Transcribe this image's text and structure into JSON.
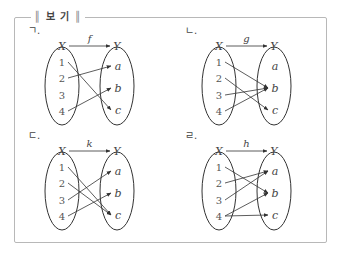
{
  "box": {
    "title": "보 기",
    "title_left_bar": "║",
    "title_right_bar": "║"
  },
  "colors": {
    "border": "#b8b8b8",
    "stroke": "#333333",
    "text": "#444444"
  },
  "panels": [
    {
      "label": "ㄱ.",
      "function": "f",
      "domain_name": "X",
      "codomain_name": "Y",
      "domain": [
        "1",
        "2",
        "3",
        "4"
      ],
      "codomain": [
        "a",
        "b",
        "c"
      ],
      "mappings": [
        [
          "1",
          "c"
        ],
        [
          "2",
          "a"
        ],
        [
          "4",
          "b"
        ]
      ]
    },
    {
      "label": "ㄴ.",
      "function": "g",
      "domain_name": "X",
      "codomain_name": "Y",
      "domain": [
        "1",
        "2",
        "3",
        "4"
      ],
      "codomain": [
        "a",
        "b",
        "c"
      ],
      "mappings": [
        [
          "1",
          "b"
        ],
        [
          "2",
          "c"
        ],
        [
          "3",
          "b"
        ],
        [
          "4",
          "b"
        ]
      ]
    },
    {
      "label": "ㄷ.",
      "function": "k",
      "domain_name": "X",
      "codomain_name": "Y",
      "domain": [
        "1",
        "2",
        "3",
        "4"
      ],
      "codomain": [
        "a",
        "b",
        "c"
      ],
      "mappings": [
        [
          "1",
          "c"
        ],
        [
          "2",
          "c"
        ],
        [
          "3",
          "a"
        ],
        [
          "4",
          "b"
        ]
      ]
    },
    {
      "label": "ㄹ.",
      "function": "h",
      "domain_name": "X",
      "codomain_name": "Y",
      "domain": [
        "1",
        "2",
        "3",
        "4"
      ],
      "codomain": [
        "a",
        "b",
        "c"
      ],
      "mappings": [
        [
          "1",
          "b"
        ],
        [
          "2",
          "a"
        ],
        [
          "3",
          "a"
        ],
        [
          "4",
          "b"
        ],
        [
          "4",
          "c"
        ]
      ]
    }
  ]
}
